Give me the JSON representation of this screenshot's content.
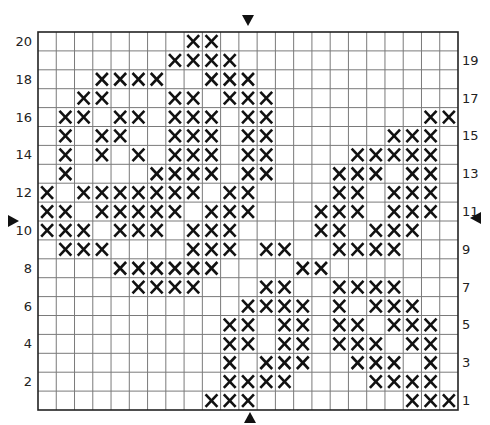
{
  "pattern": {
    "columns": 23,
    "rows": 20,
    "grid": {
      "left": 38,
      "top": 32,
      "width": 420,
      "height": 378
    },
    "colors": {
      "line": "#7a7a7a",
      "border": "#222222",
      "stitch": "#111111",
      "background": "#ffffff"
    },
    "left_labels": [
      20,
      18,
      16,
      14,
      12,
      10,
      8,
      6,
      4,
      2
    ],
    "right_labels": [
      19,
      17,
      15,
      13,
      11,
      9,
      7,
      5,
      3,
      1
    ],
    "center_markers": [
      "top-triangle",
      "bottom-triangle",
      "left-triangle",
      "right-triangle"
    ],
    "stitch_symbol": "X",
    "filled_cells_by_row": {
      "20": [
        8,
        9
      ],
      "19": [
        7,
        8,
        9,
        10
      ],
      "18": [
        3,
        4,
        5,
        6,
        9,
        10,
        11
      ],
      "17": [
        2,
        3,
        7,
        8,
        10,
        11,
        12
      ],
      "16": [
        1,
        2,
        4,
        5,
        7,
        8,
        9,
        11,
        12,
        21,
        22
      ],
      "15": [
        1,
        3,
        4,
        7,
        8,
        9,
        11,
        12,
        19,
        20,
        21
      ],
      "14": [
        1,
        3,
        5,
        7,
        8,
        9,
        11,
        12,
        17,
        18,
        19,
        20,
        21
      ],
      "13": [
        1,
        6,
        7,
        8,
        9,
        11,
        12,
        16,
        17,
        18,
        20,
        21
      ],
      "12": [
        0,
        2,
        3,
        4,
        5,
        6,
        7,
        8,
        10,
        11,
        16,
        17,
        19,
        20,
        21
      ],
      "11": [
        0,
        1,
        3,
        4,
        5,
        6,
        7,
        9,
        10,
        11,
        15,
        16,
        17,
        19,
        20,
        21
      ],
      "10": [
        0,
        1,
        2,
        4,
        5,
        6,
        8,
        9,
        10,
        15,
        16,
        18,
        19,
        20
      ],
      "9": [
        1,
        2,
        3,
        8,
        9,
        10,
        12,
        13,
        16,
        17,
        18,
        19
      ],
      "8": [
        4,
        5,
        6,
        7,
        8,
        9,
        14,
        15
      ],
      "7": [
        5,
        6,
        7,
        8,
        12,
        13,
        16,
        17,
        18,
        19
      ],
      "6": [
        11,
        12,
        13,
        14,
        16,
        18,
        19,
        20
      ],
      "5": [
        10,
        11,
        13,
        14,
        16,
        17,
        19,
        20,
        21
      ],
      "4": [
        10,
        11,
        13,
        14,
        16,
        17,
        18,
        20,
        21
      ],
      "3": [
        10,
        12,
        13,
        14,
        17,
        18,
        19,
        21
      ],
      "2": [
        10,
        11,
        12,
        13,
        18,
        19,
        20,
        21
      ],
      "1": [
        9,
        10,
        11,
        20,
        21,
        22
      ]
    }
  }
}
